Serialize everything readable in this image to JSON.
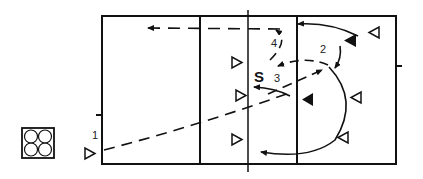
{
  "diagram": {
    "colors": {
      "line": "#111111",
      "background": "#ffffff"
    },
    "labels": {
      "setter": "S",
      "step1": "1",
      "step2": "2",
      "step3": "3",
      "step4": "4"
    },
    "players": {
      "offense_open_left_facing_right": 4,
      "defense_open_right_facing_left": 3,
      "defense_filled_facing_left": 2
    },
    "legend": {
      "icon": "rotation-formation-icon",
      "circles": 4
    }
  }
}
